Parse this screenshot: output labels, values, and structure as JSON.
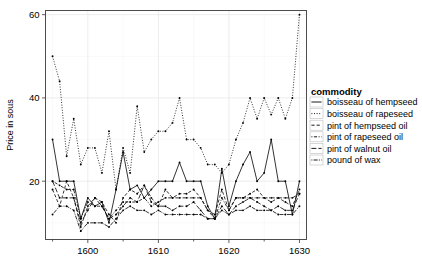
{
  "chart_data": {
    "type": "line",
    "title": "",
    "subtitle": "",
    "xlabel": "",
    "ylabel": "Price in sous",
    "xlim": [
      1594,
      1631
    ],
    "ylim": [
      6,
      61
    ],
    "x_ticks": [
      1600,
      1610,
      1620,
      1630
    ],
    "y_ticks": [
      20,
      40,
      60
    ],
    "grid": true,
    "legend_position": "right",
    "legend_title": "commodity",
    "markers": "filled-circle",
    "x": [
      1595,
      1596,
      1597,
      1598,
      1599,
      1600,
      1601,
      1602,
      1603,
      1604,
      1605,
      1606,
      1607,
      1608,
      1609,
      1610,
      1611,
      1612,
      1613,
      1614,
      1615,
      1616,
      1617,
      1618,
      1619,
      1620,
      1621,
      1622,
      1623,
      1624,
      1625,
      1626,
      1627,
      1628,
      1629,
      1630
    ],
    "series": [
      {
        "name": "boisseau of hempseed",
        "linetype": "solid",
        "values": [
          30,
          20,
          20,
          20,
          11,
          16,
          14,
          15,
          10,
          18,
          27,
          18,
          19,
          16,
          18,
          20,
          20,
          20,
          24.5,
          20,
          20,
          20,
          14,
          11,
          23,
          14,
          20,
          24,
          27,
          20,
          22,
          30,
          20,
          20,
          12,
          20
        ]
      },
      {
        "name": "boisseau of rapeseed",
        "linetype": "dotted",
        "values": [
          50,
          44,
          26,
          35,
          24,
          28,
          28,
          22,
          32,
          18,
          28,
          22,
          38,
          27,
          30,
          32,
          32,
          34,
          40,
          30,
          30,
          28,
          24,
          24,
          22,
          24,
          30,
          34,
          40,
          35,
          40,
          36,
          40,
          35,
          40,
          60
        ]
      },
      {
        "name": "pint of hempseed oil",
        "linetype": "dashed",
        "values": [
          18,
          14,
          20,
          16,
          9,
          14,
          16,
          15,
          12,
          10,
          16,
          18,
          17,
          19,
          16,
          14,
          18,
          16,
          17,
          17,
          18,
          16,
          13,
          12,
          18,
          13,
          16,
          16,
          17,
          18,
          16,
          15,
          16,
          15,
          14,
          18
        ]
      },
      {
        "name": "pint of rapeseed oil",
        "linetype": "dotdash",
        "values": [
          20,
          19,
          18,
          18,
          11,
          15,
          14,
          14,
          11,
          13,
          15,
          15,
          15,
          16,
          14,
          15,
          16,
          16,
          16,
          16,
          16,
          16,
          13,
          11,
          16,
          13,
          16,
          16,
          16,
          16,
          16,
          16,
          16,
          16,
          16,
          17
        ]
      },
      {
        "name": "pint of walnut oil",
        "linetype": "longdash",
        "values": [
          20,
          16,
          16,
          16,
          10,
          13,
          16,
          14,
          11,
          12,
          14,
          16,
          15,
          19,
          15,
          14,
          14,
          13,
          14,
          14,
          15,
          13,
          11,
          11,
          14,
          12,
          14,
          15,
          16,
          15,
          14,
          13,
          14,
          13,
          13,
          17
        ]
      },
      {
        "name": "pound of wax",
        "linetype": "twodash",
        "values": [
          12,
          14,
          14,
          13,
          8,
          10,
          10,
          10,
          9,
          11,
          13,
          14,
          13,
          13,
          12,
          13,
          12,
          12,
          12,
          12,
          12,
          12,
          11,
          11,
          13,
          12,
          13,
          13,
          14,
          13,
          13,
          13,
          12,
          12,
          12,
          14
        ]
      }
    ],
    "axis_color": "#4d4d4d",
    "line_color": "#000000",
    "grid_color": "#e8e8e8",
    "background_color": "#ffffff"
  }
}
